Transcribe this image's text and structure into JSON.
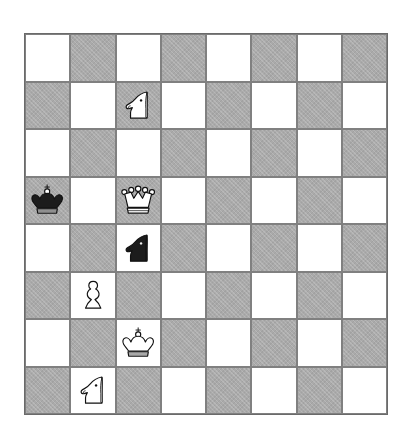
{
  "app": {
    "title": "Chess Position Diagram",
    "background_color": "#ffffff"
  },
  "board": {
    "name": "chessboard",
    "files": [
      "a",
      "b",
      "c",
      "d",
      "e",
      "f",
      "g",
      "h"
    ],
    "ranks": [
      "8",
      "7",
      "6",
      "5",
      "4",
      "3",
      "2",
      "1"
    ],
    "rows": 8,
    "columns": 8,
    "light_square_color": "#ffffff",
    "dark_square_color": "#aaaaaa",
    "border_color": "#6a6a6a",
    "gridline_color": "#808080",
    "orientation": "white-bottom",
    "coordinates_shown": false,
    "top_left_square_color": "light",
    "squares": [
      [
        {
          "square": "a8",
          "shade": "light",
          "piece": null
        },
        {
          "square": "b8",
          "shade": "dark",
          "piece": null
        },
        {
          "square": "c8",
          "shade": "light",
          "piece": null
        },
        {
          "square": "d8",
          "shade": "dark",
          "piece": null
        },
        {
          "square": "e8",
          "shade": "light",
          "piece": null
        },
        {
          "square": "f8",
          "shade": "dark",
          "piece": null
        },
        {
          "square": "g8",
          "shade": "light",
          "piece": null
        },
        {
          "square": "h8",
          "shade": "dark",
          "piece": null
        }
      ],
      [
        {
          "square": "a7",
          "shade": "dark",
          "piece": null
        },
        {
          "square": "b7",
          "shade": "light",
          "piece": null
        },
        {
          "square": "c7",
          "shade": "dark",
          "piece": {
            "type": "knight",
            "color": "white",
            "name": "white-knight",
            "symbol": "♘"
          }
        },
        {
          "square": "d7",
          "shade": "light",
          "piece": null
        },
        {
          "square": "e7",
          "shade": "dark",
          "piece": null
        },
        {
          "square": "f7",
          "shade": "light",
          "piece": null
        },
        {
          "square": "g7",
          "shade": "dark",
          "piece": null
        },
        {
          "square": "h7",
          "shade": "light",
          "piece": null
        }
      ],
      [
        {
          "square": "a6",
          "shade": "light",
          "piece": null
        },
        {
          "square": "b6",
          "shade": "dark",
          "piece": null
        },
        {
          "square": "c6",
          "shade": "light",
          "piece": null
        },
        {
          "square": "d6",
          "shade": "dark",
          "piece": null
        },
        {
          "square": "e6",
          "shade": "light",
          "piece": null
        },
        {
          "square": "f6",
          "shade": "dark",
          "piece": null
        },
        {
          "square": "g6",
          "shade": "light",
          "piece": null
        },
        {
          "square": "h6",
          "shade": "dark",
          "piece": null
        }
      ],
      [
        {
          "square": "a5",
          "shade": "dark",
          "piece": {
            "type": "king",
            "color": "black",
            "name": "black-king",
            "symbol": "♚"
          }
        },
        {
          "square": "b5",
          "shade": "light",
          "piece": null
        },
        {
          "square": "c5",
          "shade": "dark",
          "piece": {
            "type": "queen",
            "color": "white",
            "name": "white-queen",
            "symbol": "♕"
          }
        },
        {
          "square": "d5",
          "shade": "light",
          "piece": null
        },
        {
          "square": "e5",
          "shade": "dark",
          "piece": null
        },
        {
          "square": "f5",
          "shade": "light",
          "piece": null
        },
        {
          "square": "g5",
          "shade": "dark",
          "piece": null
        },
        {
          "square": "h5",
          "shade": "light",
          "piece": null
        }
      ],
      [
        {
          "square": "a4",
          "shade": "light",
          "piece": null
        },
        {
          "square": "b4",
          "shade": "dark",
          "piece": null
        },
        {
          "square": "c4",
          "shade": "light",
          "piece": {
            "type": "knight",
            "color": "black",
            "name": "black-knight",
            "symbol": "♞"
          }
        },
        {
          "square": "d4",
          "shade": "dark",
          "piece": null
        },
        {
          "square": "e4",
          "shade": "light",
          "piece": null
        },
        {
          "square": "f4",
          "shade": "dark",
          "piece": null
        },
        {
          "square": "g4",
          "shade": "light",
          "piece": null
        },
        {
          "square": "h4",
          "shade": "dark",
          "piece": null
        }
      ],
      [
        {
          "square": "a3",
          "shade": "dark",
          "piece": null
        },
        {
          "square": "b3",
          "shade": "light",
          "piece": {
            "type": "pawn",
            "color": "white",
            "name": "white-pawn",
            "symbol": "♙"
          }
        },
        {
          "square": "c3",
          "shade": "dark",
          "piece": null
        },
        {
          "square": "d3",
          "shade": "light",
          "piece": null
        },
        {
          "square": "e3",
          "shade": "dark",
          "piece": null
        },
        {
          "square": "f3",
          "shade": "light",
          "piece": null
        },
        {
          "square": "g3",
          "shade": "dark",
          "piece": null
        },
        {
          "square": "h3",
          "shade": "light",
          "piece": null
        }
      ],
      [
        {
          "square": "a2",
          "shade": "light",
          "piece": null
        },
        {
          "square": "b2",
          "shade": "dark",
          "piece": null
        },
        {
          "square": "c2",
          "shade": "light",
          "piece": {
            "type": "king",
            "color": "white",
            "name": "white-king",
            "symbol": "♔"
          }
        },
        {
          "square": "d2",
          "shade": "dark",
          "piece": null
        },
        {
          "square": "e2",
          "shade": "light",
          "piece": null
        },
        {
          "square": "f2",
          "shade": "dark",
          "piece": null
        },
        {
          "square": "g2",
          "shade": "light",
          "piece": null
        },
        {
          "square": "h2",
          "shade": "dark",
          "piece": null
        }
      ],
      [
        {
          "square": "a1",
          "shade": "dark",
          "piece": null
        },
        {
          "square": "b1",
          "shade": "light",
          "piece": {
            "type": "knight",
            "color": "white",
            "name": "white-knight",
            "symbol": "♘"
          }
        },
        {
          "square": "c1",
          "shade": "dark",
          "piece": null
        },
        {
          "square": "d1",
          "shade": "light",
          "piece": null
        },
        {
          "square": "e1",
          "shade": "dark",
          "piece": null
        },
        {
          "square": "f1",
          "shade": "light",
          "piece": null
        },
        {
          "square": "g1",
          "shade": "dark",
          "piece": null
        },
        {
          "square": "h1",
          "shade": "light",
          "piece": null
        }
      ]
    ],
    "pieces_placed": [
      {
        "square": "c7",
        "piece": "white-knight"
      },
      {
        "square": "a5",
        "piece": "black-king"
      },
      {
        "square": "c5",
        "piece": "white-queen"
      },
      {
        "square": "c4",
        "piece": "black-knight"
      },
      {
        "square": "b3",
        "piece": "white-pawn"
      },
      {
        "square": "c2",
        "piece": "white-king"
      },
      {
        "square": "b1",
        "piece": "white-knight"
      }
    ],
    "fen": "8/2N5/8/k1Q5/2n5/1P6/2K5/1N6"
  }
}
